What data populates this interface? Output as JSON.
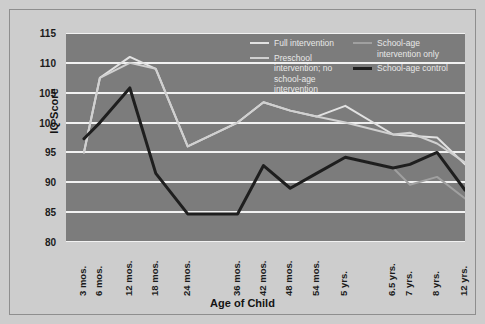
{
  "chart_data": {
    "type": "line",
    "title": "",
    "xlabel": "Age of Child",
    "ylabel": "IQ Score",
    "ylim": [
      80,
      115
    ],
    "yticks": [
      80,
      85,
      90,
      95,
      100,
      105,
      110,
      115
    ],
    "grid": true,
    "legend_position": "top-right-inside",
    "categories": [
      "3 mos.",
      "6 mos.",
      "12 mos.",
      "18 mos.",
      "24 mos.",
      "36 mos.",
      "42 mos.",
      "48 mos.",
      "54 mos.",
      "5 yrs.",
      "6.5 yrs.",
      "7 yrs.",
      "8 yrs.",
      "12 yrs."
    ],
    "series": [
      {
        "name": "Full intervention",
        "color": "#e2e2e2",
        "width": 2,
        "values": [
          95,
          107.5,
          111,
          109,
          96,
          100,
          103.4,
          102,
          101,
          102.8,
          98,
          97.8,
          97.5,
          93
        ]
      },
      {
        "name": "Preschool intervention; no school-age intervention",
        "color": "#d0d0d0",
        "width": 2,
        "values": [
          95,
          107.5,
          110,
          109,
          96,
          100,
          103.4,
          102,
          101,
          100,
          98,
          98.3,
          96.5,
          93.3
        ]
      },
      {
        "name": "School-age intervention only",
        "color": "#a0a0a0",
        "width": 2,
        "values": [
          null,
          null,
          null,
          null,
          null,
          null,
          null,
          null,
          null,
          94.2,
          92.4,
          89.6,
          90.9,
          87.3
        ]
      },
      {
        "name": "School-age control",
        "color": "#1e1e1e",
        "width": 3,
        "values": [
          97.3,
          100,
          105.8,
          91.5,
          84.7,
          84.7,
          92.8,
          89,
          91.5,
          94.2,
          92.4,
          93,
          95,
          88.7
        ]
      }
    ]
  },
  "axes": {
    "y_title": "IQ Score",
    "x_title": "Age of Child",
    "y_tick_labels": [
      "115",
      "110",
      "105",
      "100",
      "95",
      "90",
      "85",
      "80"
    ],
    "x_tick_labels": [
      "3 mos.",
      "6 mos.",
      "12 mos.",
      "18 mos.",
      "24 mos.",
      "36 mos.",
      "42 mos.",
      "48 mos.",
      "54 mos.",
      "5 yrs.",
      "6.5 yrs.",
      "7 yrs.",
      "8 yrs.",
      "12 yrs."
    ]
  },
  "legend": {
    "left_column": [
      {
        "label": "Full intervention",
        "color": "#e2e2e2",
        "thick": false
      },
      {
        "label": "Preschool intervention; no school-age intervention",
        "color": "#d0d0d0",
        "thick": false
      }
    ],
    "right_column": [
      {
        "label": "School-age intervention only",
        "color": "#a0a0a0",
        "thick": false
      },
      {
        "label": "School-age control",
        "color": "#1e1e1e",
        "thick": true
      }
    ]
  },
  "colors": {
    "panel_background": "#7c7c7c",
    "figure_background": "#cdcdcd",
    "gridline": "#f2f2f2",
    "frame_border": "#8e8e8e",
    "text": "#1b1b1b"
  }
}
